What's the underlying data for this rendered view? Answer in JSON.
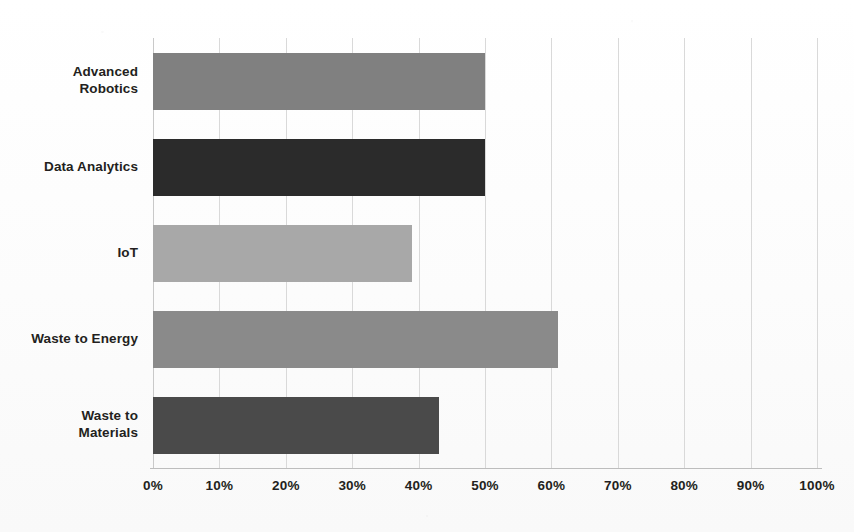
{
  "chart_data": {
    "type": "bar",
    "orientation": "horizontal",
    "title": "",
    "subtitle": "",
    "xlabel": "",
    "ylabel": "",
    "categories": [
      "Advanced\nRobotics",
      "Data Analytics",
      "IoT",
      "Waste to Energy",
      "Waste to\nMaterials"
    ],
    "values": [
      50,
      50,
      39,
      61,
      43
    ],
    "value_suffix": "%",
    "xlim": [
      0,
      100
    ],
    "xticks": [
      0,
      10,
      20,
      30,
      40,
      50,
      60,
      70,
      80,
      90,
      100
    ],
    "xtick_labels": [
      "0%",
      "10%",
      "20%",
      "30%",
      "40%",
      "50%",
      "60%",
      "70%",
      "80%",
      "90%",
      "100%"
    ],
    "grid": true,
    "grid_axis": "x",
    "legend": false,
    "legend_position": "none",
    "data_labels": false,
    "bar_colors": [
      "#808080",
      "#2b2b2b",
      "#a8a8a8",
      "#8a8a8a",
      "#4a4a4a"
    ],
    "bars": [
      {
        "category": "Advanced Robotics",
        "value": 50,
        "color": "#808080"
      },
      {
        "category": "Data Analytics",
        "value": 50,
        "color": "#2b2b2b"
      },
      {
        "category": "IoT",
        "value": 39,
        "color": "#a8a8a8"
      },
      {
        "category": "Waste to Energy",
        "value": 61,
        "color": "#8a8a8a"
      },
      {
        "category": "Waste to Materials",
        "value": 43,
        "color": "#4a4a4a"
      }
    ]
  },
  "style": {
    "background": "#fdfdfd",
    "gridline_color": "#d9d9d9",
    "axis_line_color": "#bdbdbd",
    "text_color": "#231f20"
  }
}
